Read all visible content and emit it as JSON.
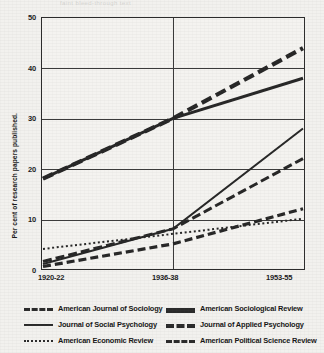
{
  "page": {
    "bleed_text": "faint bleed-through text"
  },
  "chart_data": {
    "type": "line",
    "title": "",
    "xlabel": "",
    "ylabel": "Per cent of research papers published.",
    "categories": [
      "1920-22",
      "1936-38",
      "1953-55"
    ],
    "x_tick_labels": [
      "1920-22",
      "1936-38",
      "1953-55"
    ],
    "y_tick_labels": [
      "0",
      "10",
      "20",
      "30",
      "40",
      "50"
    ],
    "y_ticks": [
      0,
      10,
      20,
      30,
      40,
      50
    ],
    "ylim": [
      0,
      50
    ],
    "grid": "horizontal-and-vertical",
    "legend_position": "below-plot-two-columns",
    "series": [
      {
        "name": "American Journal of Sociology",
        "style": "long-dash",
        "values": [
          18,
          30,
          44
        ]
      },
      {
        "name": "American Sociological Review",
        "style": "thick-solid",
        "values": [
          18,
          30,
          38
        ]
      },
      {
        "name": "Journal of Social Psychology",
        "style": "solid",
        "values": [
          1,
          8,
          28
        ]
      },
      {
        "name": "Journal of Applied Psychology",
        "style": "medium-dash",
        "values": [
          0.5,
          5,
          12
        ]
      },
      {
        "name": "American Economic Review",
        "style": "dotted",
        "values": [
          4,
          7,
          10
        ]
      },
      {
        "name": "American Political Science Review",
        "style": "dash-dot",
        "values": [
          1.5,
          8,
          22
        ]
      }
    ]
  },
  "legend": {
    "left_column": [
      "American Journal of Sociology",
      "Journal of Social Psychology",
      "American Economic Review"
    ],
    "right_column": [
      "American Sociological Review",
      "Journal of Applied Psychology",
      "American Political Science Review"
    ]
  }
}
